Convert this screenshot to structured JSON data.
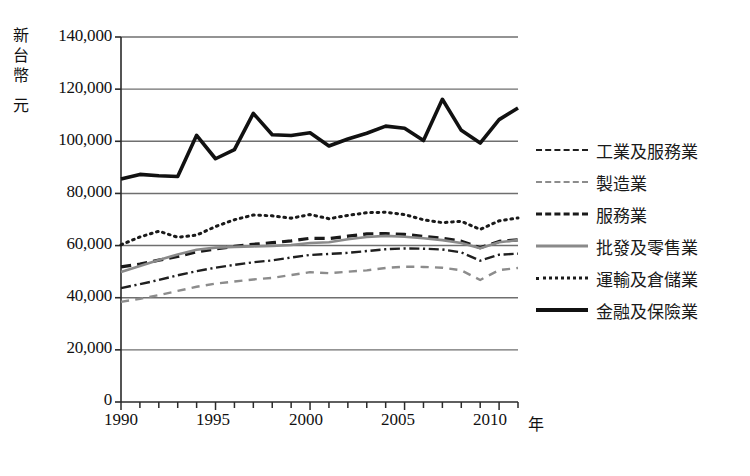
{
  "chart_data": {
    "type": "line",
    "title": "",
    "xlabel": "年",
    "ylabel": "新台幣 元",
    "ylabel_chars": [
      "新",
      "台",
      "幣",
      "元"
    ],
    "xlim": [
      1990,
      2011
    ],
    "ylim": [
      0,
      140000
    ],
    "ytick_values": [
      0,
      20000,
      40000,
      60000,
      80000,
      100000,
      120000,
      140000
    ],
    "ytick_labels": [
      "0",
      "20,000",
      "40,000",
      "60,000",
      "80,000",
      "100,000",
      "120,000",
      "140,000"
    ],
    "xtick_values": [
      1990,
      1995,
      2000,
      2005,
      2010
    ],
    "xtick_labels": [
      "1990",
      "1995",
      "2000",
      "2005",
      "2010"
    ],
    "x": [
      1990,
      1991,
      1992,
      1993,
      1994,
      1995,
      1996,
      1997,
      1998,
      1999,
      2000,
      2001,
      2002,
      2003,
      2004,
      2005,
      2006,
      2007,
      2008,
      2009,
      2010,
      2011
    ],
    "grid": "horizontal",
    "legend_position": "right",
    "series": [
      {
        "name": "工業及服務業",
        "style": "dash-dot",
        "color": "#1f1f1f",
        "width": 2.4,
        "values": [
          43700,
          45200,
          46800,
          48600,
          50200,
          51500,
          52600,
          53600,
          54300,
          55400,
          56400,
          56800,
          57200,
          57900,
          58600,
          58900,
          58800,
          58500,
          57400,
          54200,
          56500,
          56900
        ]
      },
      {
        "name": "製造業",
        "style": "dashed-light",
        "color": "#8c8c8c",
        "width": 2.4,
        "values": [
          38400,
          39600,
          41000,
          42600,
          44200,
          45400,
          46200,
          47000,
          47600,
          48700,
          49800,
          49400,
          50000,
          50500,
          51400,
          51900,
          51800,
          51500,
          50500,
          46800,
          50600,
          51400
        ]
      },
      {
        "name": "服務業",
        "style": "dashed-bold",
        "color": "#1a1a1a",
        "width": 3.2,
        "values": [
          51800,
          52900,
          54400,
          55800,
          57600,
          58700,
          59700,
          60500,
          61100,
          61800,
          62800,
          62700,
          63600,
          64500,
          64600,
          64300,
          63500,
          62800,
          61700,
          59200,
          61600,
          62200
        ]
      },
      {
        "name": "批發及零售業",
        "style": "solid-gray",
        "color": "#8a8a8a",
        "width": 2.6,
        "values": [
          49900,
          52200,
          54500,
          56600,
          58400,
          59200,
          59500,
          59700,
          59900,
          60200,
          61000,
          61300,
          62400,
          63300,
          63700,
          63400,
          62800,
          62100,
          61000,
          59000,
          61300,
          62100
        ]
      },
      {
        "name": "運輸及倉儲業",
        "style": "dotted",
        "color": "#1a1a1a",
        "width": 3.0,
        "values": [
          60300,
          63300,
          65500,
          63200,
          64000,
          67300,
          69900,
          71700,
          71400,
          70500,
          71900,
          70300,
          71600,
          72600,
          72800,
          71900,
          69900,
          68800,
          69300,
          66200,
          69500,
          70600
        ]
      },
      {
        "name": "金融及保險業",
        "style": "solid-bold",
        "color": "#111111",
        "width": 3.6,
        "values": [
          85500,
          87300,
          86800,
          86500,
          102300,
          93300,
          96800,
          110700,
          102500,
          102200,
          103300,
          98200,
          100900,
          103100,
          105800,
          105000,
          100300,
          116100,
          104200,
          99300,
          108300,
          112800
        ]
      }
    ]
  }
}
